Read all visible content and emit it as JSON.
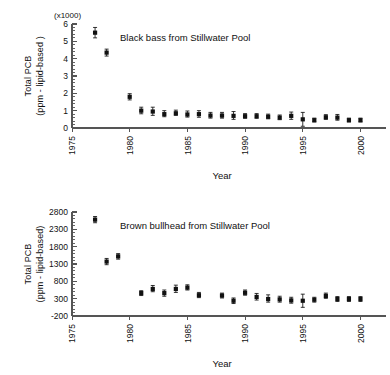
{
  "figure": {
    "background": "#ffffff",
    "marker_color": "#111111",
    "axis_color": "#555555"
  },
  "chart_data": [
    {
      "type": "scatter",
      "id": "black-bass",
      "title": "Black bass from Stillwater Pool",
      "xlabel": "Year",
      "ylabel_line1": "Total PCB",
      "ylabel_line2": "(ppm - lipid-based )",
      "y_multiplier_label": "(x1000)",
      "xlim": [
        1975,
        2001
      ],
      "ylim": [
        0,
        6
      ],
      "xticks": [
        1975,
        1980,
        1985,
        1990,
        1995,
        2000
      ],
      "xtick_labels": [
        "1975",
        "1980",
        "1985",
        "1990",
        "1995",
        "2000"
      ],
      "yticks": [
        0,
        1,
        2,
        3,
        4,
        5,
        6
      ],
      "ytick_labels": [
        "0",
        "1",
        "2",
        "3",
        "4",
        "5",
        "6"
      ],
      "y_minor_step": 0.2,
      "grid": false,
      "legend": "none",
      "error_bars": "vertical",
      "units_note": "values in thousands of ppm lipid-based",
      "x": [
        1977,
        1978,
        1980,
        1981,
        1982,
        1983,
        1984,
        1985,
        1986,
        1987,
        1988,
        1989,
        1990,
        1991,
        1992,
        1993,
        1994,
        1995,
        1996,
        1997,
        1998,
        1999,
        2000
      ],
      "values": [
        5.5,
        4.35,
        1.8,
        1.0,
        0.95,
        0.8,
        0.85,
        0.78,
        0.8,
        0.72,
        0.72,
        0.7,
        0.68,
        0.68,
        0.65,
        0.6,
        0.7,
        0.5,
        0.45,
        0.62,
        0.6,
        0.45,
        0.45
      ],
      "err_low": [
        0.3,
        0.2,
        0.18,
        0.18,
        0.22,
        0.15,
        0.12,
        0.15,
        0.18,
        0.15,
        0.15,
        0.2,
        0.12,
        0.12,
        0.12,
        0.12,
        0.2,
        0.4,
        0.1,
        0.12,
        0.15,
        0.1,
        0.1
      ],
      "err_high": [
        0.3,
        0.2,
        0.18,
        0.2,
        0.25,
        0.2,
        0.18,
        0.2,
        0.2,
        0.18,
        0.18,
        0.25,
        0.15,
        0.15,
        0.15,
        0.15,
        0.22,
        0.4,
        0.12,
        0.15,
        0.18,
        0.12,
        0.12
      ]
    },
    {
      "type": "scatter",
      "id": "brown-bullhead",
      "title": "Brown bullhead from Stillwater Pool",
      "xlabel": "Year",
      "ylabel_line1": "Total PCB",
      "ylabel_line2": "(ppm - lipid-based)",
      "y_multiplier_label": "",
      "xlim": [
        1975,
        2001
      ],
      "ylim": [
        -200,
        2800
      ],
      "xticks": [
        1975,
        1980,
        1985,
        1990,
        1995,
        2000
      ],
      "xtick_labels": [
        "1975",
        "1980",
        "1985",
        "1990",
        "1995",
        "2000"
      ],
      "yticks": [
        -200,
        300,
        800,
        1300,
        1800,
        2300,
        2800
      ],
      "ytick_labels": [
        "-200",
        "300",
        "800",
        "1300",
        "1800",
        "2300",
        "2800"
      ],
      "y_minor_step": 100,
      "grid": false,
      "legend": "none",
      "error_bars": "vertical",
      "units_note": "ppm lipid-based",
      "x": [
        1977,
        1978,
        1979,
        1981,
        1982,
        1983,
        1984,
        1985,
        1986,
        1988,
        1989,
        1990,
        1991,
        1992,
        1993,
        1994,
        1995,
        1996,
        1997,
        1998,
        1999,
        2000
      ],
      "values": [
        2580,
        1370,
        1520,
        460,
        580,
        460,
        580,
        620,
        400,
        390,
        240,
        470,
        350,
        290,
        280,
        250,
        240,
        270,
        380,
        290,
        290,
        290
      ],
      "err_low": [
        90,
        90,
        80,
        70,
        80,
        90,
        100,
        70,
        70,
        70,
        80,
        70,
        90,
        90,
        80,
        80,
        190,
        70,
        70,
        70,
        70,
        70
      ],
      "err_high": [
        90,
        90,
        80,
        70,
        100,
        90,
        110,
        80,
        80,
        70,
        80,
        80,
        100,
        120,
        90,
        90,
        190,
        70,
        80,
        70,
        70,
        70
      ]
    }
  ]
}
